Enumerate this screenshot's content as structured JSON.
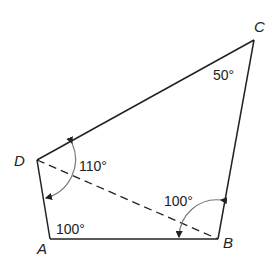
{
  "diagram": {
    "type": "quadrilateral",
    "vertices": {
      "A": {
        "label": "A"
      },
      "B": {
        "label": "B"
      },
      "C": {
        "label": "C"
      },
      "D": {
        "label": "D"
      }
    },
    "angles": {
      "A": "100°",
      "ABD": "100°",
      "C": "50°",
      "ADB": "110°"
    },
    "edges": [
      "AB",
      "BC",
      "CD",
      "DA"
    ],
    "diagonal": {
      "from": "D",
      "to": "B",
      "style": "dashed"
    },
    "colors": {
      "line": "#222222",
      "arc": "#777777",
      "background": "#ffffff"
    }
  }
}
